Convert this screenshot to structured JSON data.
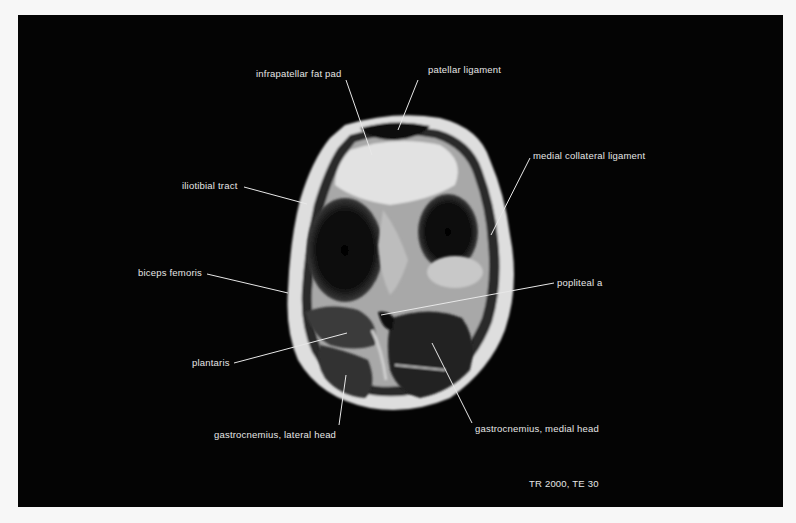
{
  "figure": {
    "type": "axial MRI of knee",
    "sequence": "TR 2000, TE 30",
    "labels": [
      {
        "id": "infrapatellar-fat-pad",
        "text": "infrapatellar fat pad",
        "x": 256,
        "y": 68,
        "line": [
          346,
          80,
          372,
          155
        ]
      },
      {
        "id": "patellar-ligament",
        "text": "patellar ligament",
        "x": 428,
        "y": 64,
        "line": [
          418,
          80,
          398,
          130
        ]
      },
      {
        "id": "medial-collateral-ligament",
        "text": "medial collateral ligament",
        "x": 533,
        "y": 150,
        "line": [
          530,
          158,
          491,
          235
        ]
      },
      {
        "id": "iliotibial-tract",
        "text": "iliotibial tract",
        "x": 182,
        "y": 180,
        "line": [
          244,
          187,
          307,
          204
        ]
      },
      {
        "id": "biceps-femoris",
        "text": "biceps femoris",
        "x": 138,
        "y": 267,
        "line": [
          207,
          274,
          288,
          293
        ]
      },
      {
        "id": "popliteal-a",
        "text": "popliteal a",
        "x": 557,
        "y": 277,
        "line": [
          554,
          283,
          381,
          315
        ]
      },
      {
        "id": "plantaris",
        "text": "plantaris",
        "x": 192,
        "y": 357,
        "line": [
          234,
          363,
          347,
          333
        ]
      },
      {
        "id": "gastrocnemius-lateral-head",
        "text": "gastrocnemius, lateral head",
        "x": 214,
        "y": 429,
        "line": [
          339,
          425,
          346,
          375
        ]
      },
      {
        "id": "gastrocnemius-medial-head",
        "text": "gastrocnemius, medial head",
        "x": 475,
        "y": 423,
        "line": [
          472,
          423,
          432,
          343
        ]
      }
    ],
    "sequence_label_pos": {
      "x": 529,
      "y": 478
    }
  },
  "text": {
    "l0": "infrapatellar fat pad",
    "l1": "patellar ligament",
    "l2": "medial collateral ligament",
    "l3": "iliotibial tract",
    "l4": "biceps femoris",
    "l5": "popliteal a",
    "l6": "plantaris",
    "l7": "gastrocnemius, lateral head",
    "l8": "gastrocnemius, medial head",
    "sequence": "TR 2000, TE 30"
  }
}
